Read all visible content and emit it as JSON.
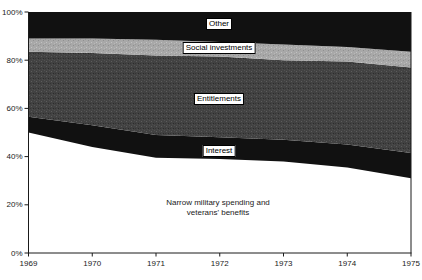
{
  "chart_data": {
    "type": "area",
    "stacked": true,
    "title": "",
    "xlabel": "",
    "ylabel": "",
    "x": [
      1969,
      1970,
      1971,
      1972,
      1973,
      1974,
      1975
    ],
    "x_tick_labels": [
      "1969",
      "1970",
      "1971",
      "1972",
      "1973",
      "1974",
      "1975"
    ],
    "y_ticks": [
      0,
      20,
      40,
      60,
      80,
      100
    ],
    "y_tick_labels": [
      "0%",
      "20%",
      "40%",
      "60%",
      "80%",
      "100%"
    ],
    "ylim": [
      0,
      100
    ],
    "grid": false,
    "legend_position": "inline-labels",
    "series": [
      {
        "name": "Narrow military spending and veterans' benefits",
        "values": [
          50,
          44,
          39.5,
          39,
          38,
          35.5,
          31
        ],
        "color": "#ffffff"
      },
      {
        "name": "Interest",
        "values": [
          6.5,
          9,
          9.5,
          9,
          9,
          9.5,
          10.5
        ],
        "color": "#111111"
      },
      {
        "name": "Entitlements",
        "values": [
          27,
          30,
          33,
          33.5,
          33,
          34.5,
          35.5
        ],
        "color": "#424242",
        "pattern": "speckle-dark"
      },
      {
        "name": "Social investments",
        "values": [
          5.5,
          6,
          6.5,
          6,
          6.5,
          6,
          6.5
        ],
        "color": "#a8a8a8",
        "pattern": "speckle-light"
      },
      {
        "name": "Other",
        "values": [
          11,
          11,
          11.5,
          12.5,
          13.5,
          14.5,
          16.5
        ],
        "color": "#111111"
      }
    ]
  },
  "area_labels": {
    "other": "Other",
    "social_investments": "Social investments",
    "entitlements": "Entitlements",
    "interest": "Interest",
    "military_line1": "Narrow military spending and",
    "military_line2": "veterans' benefits"
  },
  "colors": {
    "axis": "#1a1a1a",
    "tick_text": "#1a1a1a",
    "background": "#ffffff",
    "dark_fill": "#111111",
    "entitlements_fill": "#424242",
    "social_fill": "#a8a8a8"
  }
}
